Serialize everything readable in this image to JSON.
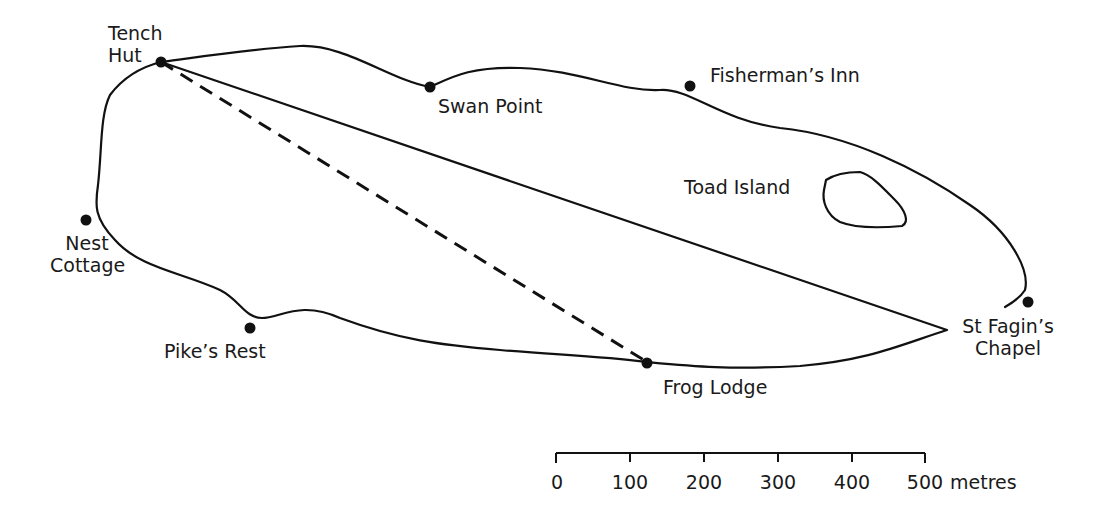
{
  "map": {
    "type": "lake-map",
    "places": [
      {
        "id": "tench-hut",
        "label_line1": "Tench",
        "label_line2": "Hut",
        "x": 161,
        "y": 62
      },
      {
        "id": "swan-point",
        "label": "Swan Point",
        "x": 430,
        "y": 87
      },
      {
        "id": "fishermans-inn",
        "label": "Fisherman’s Inn",
        "x": 690,
        "y": 86
      },
      {
        "id": "toad-island",
        "label": "Toad Island"
      },
      {
        "id": "nest-cottage",
        "label_line1": "Nest",
        "label_line2": "Cottage",
        "x": 86,
        "y": 220
      },
      {
        "id": "pikes-rest",
        "label": "Pike’s Rest",
        "x": 250,
        "y": 328
      },
      {
        "id": "frog-lodge",
        "label": "Frog Lodge",
        "x": 647,
        "y": 363
      },
      {
        "id": "st-fagins-chapel",
        "label_line1": "St Fagin’s",
        "label_line2": "Chapel",
        "x": 1028,
        "y": 302
      }
    ],
    "route": {
      "from": "Tench Hut",
      "to": "Frog Lodge",
      "style": "dashed"
    },
    "scale_bar": {
      "ticks": [
        "0",
        "100",
        "200",
        "300",
        "400",
        "500"
      ],
      "unit": "metres",
      "max_value": 500
    }
  }
}
